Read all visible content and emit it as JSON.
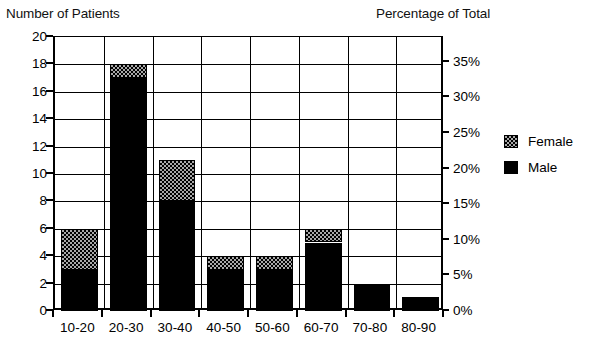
{
  "chart_data": {
    "type": "bar",
    "title": "",
    "subtitle": "",
    "stacked": true,
    "categories": [
      "10-20",
      "20-30",
      "30-40",
      "40-50",
      "50-60",
      "60-70",
      "70-80",
      "80-90"
    ],
    "series": [
      {
        "name": "Male",
        "values": [
          3,
          17,
          8,
          3,
          3,
          5,
          2,
          1
        ]
      },
      {
        "name": "Female",
        "values": [
          3,
          1,
          3,
          1,
          1,
          1,
          0,
          0
        ]
      }
    ],
    "totals": [
      6,
      18,
      11,
      4,
      4,
      6,
      2,
      1
    ],
    "xlabel": "",
    "ylabel": "Number of Patients",
    "y2label": "Percentage of Total",
    "ylim": [
      0,
      20
    ],
    "yticks": [
      0,
      2,
      4,
      6,
      8,
      10,
      12,
      14,
      16,
      18,
      20
    ],
    "ytick_labels": [
      "0",
      "2",
      "4",
      "6",
      "8",
      "10",
      "12",
      "14",
      "16",
      "18",
      "20"
    ],
    "y2lim": [
      0,
      38.46
    ],
    "y2ticks": [
      0,
      5,
      10,
      15,
      20,
      25,
      30,
      35
    ],
    "y2tick_labels": [
      "0%",
      "5%",
      "10%",
      "15%",
      "20%",
      "25%",
      "30%",
      "35%"
    ],
    "grid": true,
    "legend_position": "right",
    "legend": [
      {
        "label": "Female",
        "pattern": "checker",
        "color": "#a8a8a8"
      },
      {
        "label": "Male",
        "pattern": "solid",
        "color": "#000000"
      }
    ]
  },
  "axis_titles": {
    "left": "Number of Patients",
    "right": "Percentage of Total"
  }
}
